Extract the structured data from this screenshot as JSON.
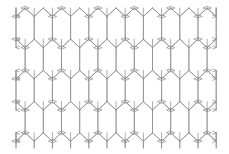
{
  "figure": {
    "background_color": "#ffffff",
    "line_color": "#8a8a8a",
    "line_width": 0.7,
    "node_color": "#8a8a8a"
  },
  "chart_data": {
    "type": "diagram",
    "pattern": "elongated-hexagon-tessellation",
    "columns": 11,
    "rows": 5,
    "origin_x": 16,
    "origin_y": 8,
    "cell_width": 18.2,
    "cell_height": 31.2,
    "apex_height": 8.4,
    "wall_height": 22.8,
    "node_shape": "lens",
    "node_half_width": 4.2,
    "node_half_height": 1.7,
    "edge_marker_shape": "chevron",
    "edge_marker_width": 4.0,
    "edge_marker_height": 3.4,
    "content_bounds": [
      16,
      8,
      216,
      148
    ],
    "grid": false,
    "legend": "none"
  }
}
